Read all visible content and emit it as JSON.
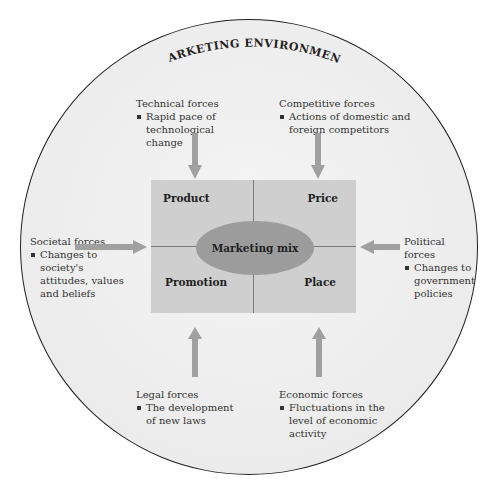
{
  "diagram": {
    "title": "MARKETING ENVIRONMENT",
    "marketing_mix": {
      "center_label": "Marketing mix",
      "quadrants": {
        "top_left": "Product",
        "top_right": "Price",
        "bottom_left": "Promotion",
        "bottom_right": "Place"
      }
    },
    "forces": {
      "technical": {
        "title": "Technical  forces",
        "bullet": "Rapid pace of technological change"
      },
      "competitive": {
        "title": "Competitive forces",
        "bullet": "Actions of domestic and foreign competitors"
      },
      "societal": {
        "title": "Societal forces",
        "bullet": "Changes to society's attitudes, values and beliefs"
      },
      "political": {
        "title": "Political forces",
        "bullet": "Changes to government policies"
      },
      "legal": {
        "title": "Legal forces",
        "bullet": "The development of new laws"
      },
      "economic": {
        "title": "Economic forces",
        "bullet": "Fluctuations in the level of economic activity"
      }
    },
    "colors": {
      "circle_fill": "#ececec",
      "circle_border": "#222222",
      "mix_box": "#cfcfcf",
      "ellipse": "#9c9c9c",
      "arrow": "#a0a0a0"
    }
  }
}
